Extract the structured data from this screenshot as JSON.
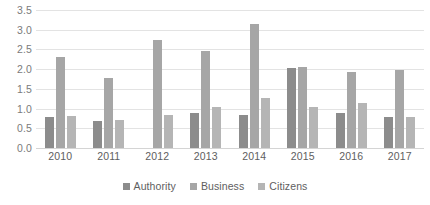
{
  "chart_data": {
    "type": "bar",
    "title": "",
    "xlabel": "",
    "ylabel": "",
    "ylim": [
      0,
      3.5
    ],
    "yticks": [
      "0.0",
      "0.5",
      "1.0",
      "1.5",
      "2.0",
      "2.5",
      "3.0",
      "3.5"
    ],
    "grid": true,
    "legend_position": "bottom",
    "categories": [
      "2010",
      "2011",
      "2012",
      "2013",
      "2014",
      "2015",
      "2016",
      "2017"
    ],
    "series": [
      {
        "name": "Authority",
        "color": "#8c8c8c",
        "values": [
          0.78,
          0.68,
          0,
          0.9,
          0.85,
          2.03,
          0.9,
          0.78
        ]
      },
      {
        "name": "Business",
        "color": "#a6a6a6",
        "values": [
          2.3,
          1.78,
          2.75,
          2.47,
          3.15,
          2.05,
          1.92,
          1.98
        ]
      },
      {
        "name": "Citizens",
        "color": "#b5b5b5",
        "values": [
          0.8,
          0.72,
          0.85,
          1.05,
          1.28,
          1.05,
          1.15,
          0.78
        ]
      }
    ]
  },
  "colors": {
    "gridline": "#e3e3e3",
    "baseline": "#d4d4d4",
    "axis_text": "#5e5e5e",
    "y_axis_text": "#7b7b7b",
    "background": "#ffffff"
  }
}
